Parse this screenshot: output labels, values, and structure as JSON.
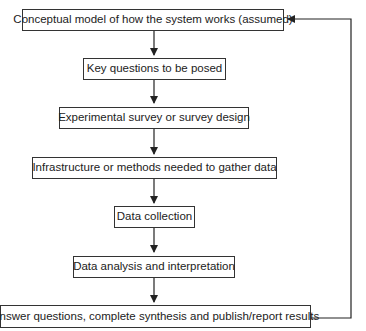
{
  "diagram": {
    "type": "flowchart",
    "steps": [
      {
        "id": "conceptual-model",
        "label": "Conceptual model of how the system works (assumed)"
      },
      {
        "id": "key-questions",
        "label": "Key questions to be posed"
      },
      {
        "id": "survey-design",
        "label": "Experimental survey or survey design"
      },
      {
        "id": "infrastructure",
        "label": "Infrastructure or methods needed to gather data"
      },
      {
        "id": "data-collection",
        "label": "Data collection"
      },
      {
        "id": "data-analysis",
        "label": "Data analysis and interpretation"
      },
      {
        "id": "answer-questions",
        "label": "Answer questions, complete synthesis and publish/report results"
      }
    ],
    "feedback_loop": {
      "from": "answer-questions",
      "to": "conceptual-model"
    },
    "colors": {
      "line": "#222222",
      "box_border": "#333333",
      "background": "#ffffff"
    }
  }
}
